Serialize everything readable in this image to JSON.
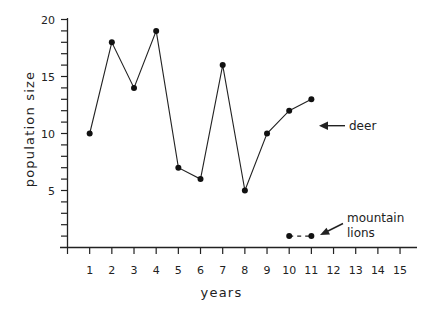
{
  "chart_data": {
    "type": "line",
    "title": "",
    "xlabel": "years",
    "ylabel": "population size",
    "xlim": [
      0,
      15
    ],
    "ylim": [
      0,
      20
    ],
    "x_ticks": [
      1,
      2,
      3,
      4,
      5,
      6,
      7,
      8,
      9,
      10,
      11,
      12,
      13,
      14,
      15
    ],
    "y_tick_labels": [
      5,
      10,
      15,
      20
    ],
    "y_minor_tick_step": 1,
    "grid": false,
    "legend": "inline annotations with arrows",
    "series": [
      {
        "name": "deer",
        "style": "solid",
        "x": [
          1,
          2,
          3,
          4,
          5,
          6,
          7,
          8,
          9,
          10,
          11
        ],
        "values": [
          10,
          18,
          14,
          19,
          7,
          6,
          16,
          5,
          10,
          12,
          13
        ]
      },
      {
        "name": "mountain lions",
        "style": "dashed",
        "x": [
          10,
          11
        ],
        "values": [
          1,
          1
        ]
      }
    ],
    "annotations": [
      {
        "text": "deer",
        "points_to_series": "deer"
      },
      {
        "text_lines": [
          "mountain",
          "lions"
        ],
        "points_to_series": "mountain lions"
      }
    ]
  },
  "labels": {
    "xlabel": "years",
    "ylabel": "population size",
    "deer": "deer",
    "lions_line1": "mountain",
    "lions_line2": "lions"
  },
  "colors": {
    "ink": "#222222",
    "background": "#ffffff"
  }
}
